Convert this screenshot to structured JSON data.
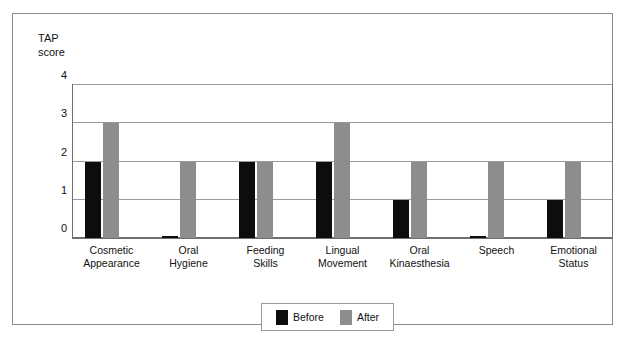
{
  "figure": {
    "y_axis_title": "TAP\nscore"
  },
  "legend": {
    "position": "bottom-center",
    "entries": [
      {
        "label": "Before",
        "color": "#0d0d0d",
        "swatch_name": "legend-swatch-before"
      },
      {
        "label": "After",
        "color": "#8d8d8d",
        "swatch_name": "legend-swatch-after"
      }
    ]
  },
  "chart_data": {
    "type": "bar",
    "title": "",
    "subtitle": "",
    "xlabel": "",
    "ylabel": "TAP score",
    "ylim": [
      0,
      4
    ],
    "yticks": [
      0,
      1,
      2,
      3,
      4
    ],
    "ytick_labels": [
      "0",
      "1",
      "2",
      "3",
      "4"
    ],
    "grid": true,
    "grid_axis": "y",
    "legend_position": "bottom-center",
    "categories": [
      "Cosmetic\nAppearance",
      "Oral\nHygiene",
      "Feeding\nSkills",
      "Lingual\nMovement",
      "Oral\nKinaesthesia",
      "Speech",
      "Emotional\nStatus"
    ],
    "series": [
      {
        "name": "Before",
        "color": "#0d0d0d",
        "values": [
          2,
          0.05,
          2,
          2,
          1,
          0.05,
          1
        ]
      },
      {
        "name": "After",
        "color": "#8d8d8d",
        "values": [
          3,
          2,
          2,
          3,
          2,
          2,
          2
        ]
      }
    ]
  }
}
